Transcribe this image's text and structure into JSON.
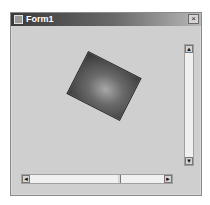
{
  "window": {
    "title": "Form1",
    "close_glyph": "×",
    "icon": "app-window-icon"
  },
  "canvas": {
    "shape": "rotated-gradient-rectangle",
    "rotation_deg": 27,
    "colors": {
      "center": "#a8a8a8",
      "edge": "#353535"
    }
  },
  "vscroll": {
    "up_glyph": "▲",
    "down_glyph": "▼",
    "position": 0
  },
  "hscroll": {
    "left_glyph": "◄",
    "right_glyph": "►",
    "position": 0.65
  }
}
